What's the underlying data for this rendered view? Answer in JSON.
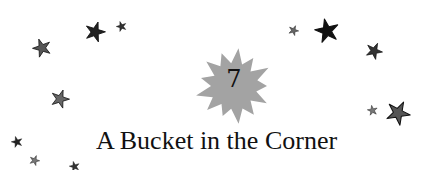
{
  "chapter": {
    "number": "7",
    "title": "A Bucket in the Corner"
  },
  "decorations": {
    "burst_color": "#a3a3a3",
    "stars": [
      {
        "x": 42,
        "y": 48,
        "size": 20,
        "color": "#555555"
      },
      {
        "x": 95,
        "y": 32,
        "size": 22,
        "color": "#222222"
      },
      {
        "x": 121,
        "y": 26,
        "size": 11,
        "color": "#333333"
      },
      {
        "x": 60,
        "y": 99,
        "size": 20,
        "color": "#666666"
      },
      {
        "x": 17,
        "y": 142,
        "size": 12,
        "color": "#222222"
      },
      {
        "x": 34,
        "y": 160,
        "size": 11,
        "color": "#777777"
      },
      {
        "x": 74,
        "y": 166,
        "size": 11,
        "color": "#333333"
      },
      {
        "x": 293,
        "y": 30,
        "size": 11,
        "color": "#666666"
      },
      {
        "x": 327,
        "y": 31,
        "size": 26,
        "color": "#111111"
      },
      {
        "x": 374,
        "y": 51,
        "size": 18,
        "color": "#333333"
      },
      {
        "x": 372,
        "y": 110,
        "size": 11,
        "color": "#777777"
      },
      {
        "x": 398,
        "y": 113,
        "size": 26,
        "color": "#555555"
      }
    ]
  }
}
